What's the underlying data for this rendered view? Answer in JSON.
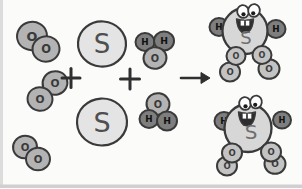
{
  "diagram": {
    "canvas": {
      "width": 302,
      "height": 188,
      "background": "#fbfbfa"
    },
    "ink": "#3a3a3a",
    "styles": {
      "O": {
        "fill": "#b3b3b3",
        "text": "#3a3a3a"
      },
      "H": {
        "fill": "#7e7e7e",
        "text": "#111111"
      },
      "S": {
        "fill": "#e4e4e4",
        "text": "#4f4f4f"
      },
      "body": {
        "fill": "#d7d7d7"
      },
      "legO": {
        "fill": "#c3c3c3"
      },
      "eye": {
        "white": "#ffffff",
        "pupil": "#1c1c1c"
      },
      "mouth": {
        "dark": "#2d2d2d",
        "teeth": "#ffffff"
      },
      "product_label_text": "#6e6e6e",
      "operator": "#2f2f2f",
      "edge_left_band": "#dcdcdc",
      "edge_bottom_band": "#d0d0d0"
    },
    "reactants": [
      {
        "name": "oxygen-molecule-1",
        "formula": "O2",
        "atoms": [
          {
            "el": "O",
            "x": 32,
            "y": 36,
            "r": 15,
            "tilt": -14
          },
          {
            "el": "O",
            "x": 46,
            "y": 49,
            "r": 13.5,
            "tilt": -8
          }
        ]
      },
      {
        "name": "oxygen-molecule-2",
        "formula": "O2",
        "atoms": [
          {
            "el": "O",
            "x": 55,
            "y": 83,
            "r": 12.5,
            "tilt": -18
          },
          {
            "el": "O",
            "x": 40,
            "y": 99,
            "r": 12.5,
            "tilt": 10
          }
        ]
      },
      {
        "name": "oxygen-molecule-3",
        "formula": "O2",
        "atoms": [
          {
            "el": "O",
            "x": 25,
            "y": 147,
            "r": 12,
            "tilt": -12
          },
          {
            "el": "O",
            "x": 38,
            "y": 159,
            "r": 12,
            "tilt": 0
          }
        ]
      },
      {
        "name": "sulfur-atom-1",
        "formula": "S",
        "atoms": [
          {
            "el": "S",
            "x": 102,
            "y": 44,
            "r": 24,
            "fs": 26,
            "tilt": 4
          }
        ]
      },
      {
        "name": "sulfur-atom-2",
        "formula": "S",
        "atoms": [
          {
            "el": "S",
            "x": 102,
            "y": 122,
            "r": 25,
            "fs": 27,
            "tilt": -3
          }
        ]
      },
      {
        "name": "water-molecule-1",
        "formula": "H2O",
        "atoms": [
          {
            "el": "H",
            "x": 145,
            "y": 42,
            "r": 9.5
          },
          {
            "el": "H",
            "x": 164,
            "y": 41,
            "r": 10
          },
          {
            "el": "O",
            "x": 155,
            "y": 58,
            "r": 11.5,
            "tilt": -10
          }
        ]
      },
      {
        "name": "water-molecule-2",
        "formula": "H2O",
        "atoms": [
          {
            "el": "O",
            "x": 158,
            "y": 104,
            "r": 11.5,
            "tilt": 8
          },
          {
            "el": "H",
            "x": 149,
            "y": 119,
            "r": 9.5
          },
          {
            "el": "H",
            "x": 167,
            "y": 121,
            "r": 10
          }
        ]
      }
    ],
    "operators": [
      {
        "type": "plus",
        "label": "+",
        "x": 71,
        "y": 78,
        "arm": 9
      },
      {
        "type": "plus",
        "label": "+",
        "x": 130,
        "y": 79,
        "arm": 9.5
      },
      {
        "type": "arrow",
        "label": "→",
        "x1": 181,
        "y1": 78,
        "x2": 210,
        "y2": 78
      }
    ],
    "products": [
      {
        "name": "sulfuric-acid-molecule-1",
        "formula": "H2SO4",
        "body": {
          "x": 245,
          "y": 31,
          "rx": 22.5,
          "ry": 23
        },
        "label": {
          "el": "S",
          "x": 246,
          "y": 38,
          "fs": 18
        },
        "hydrogens": [
          {
            "el": "H",
            "x": 219,
            "y": 27,
            "r": 9.5
          },
          {
            "el": "H",
            "x": 276,
            "y": 29,
            "r": 9.5
          }
        ],
        "oxygens": [
          {
            "el": "O",
            "x": 230,
            "y": 72,
            "r": 10
          },
          {
            "el": "O",
            "x": 236,
            "y": 56,
            "r": 9.5
          },
          {
            "el": "O",
            "x": 269,
            "y": 69,
            "r": 10.5
          },
          {
            "el": "O",
            "x": 262,
            "y": 55,
            "r": 9.5
          }
        ],
        "eyes": [
          {
            "x": 243,
            "y": 11.5
          },
          {
            "x": 254,
            "y": 10.5
          }
        ],
        "mouth": {
          "x": 245,
          "y": 25
        }
      },
      {
        "name": "sulfuric-acid-molecule-2",
        "formula": "H2SO4",
        "body": {
          "x": 248,
          "y": 128,
          "rx": 23.5,
          "ry": 24
        },
        "label": {
          "el": "S",
          "x": 251,
          "y": 132,
          "fs": 20
        },
        "hydrogens": [
          {
            "el": "H",
            "x": 224,
            "y": 121,
            "r": 9.5
          },
          {
            "el": "H",
            "x": 282,
            "y": 120,
            "r": 9
          }
        ],
        "oxygens": [
          {
            "el": "O",
            "x": 227,
            "y": 166,
            "r": 10
          },
          {
            "el": "O",
            "x": 232,
            "y": 153,
            "r": 10
          },
          {
            "el": "O",
            "x": 275,
            "y": 164,
            "r": 10.5
          },
          {
            "el": "O",
            "x": 271,
            "y": 152,
            "r": 10
          }
        ],
        "eyes": [
          {
            "x": 245,
            "y": 103.5
          },
          {
            "x": 256,
            "y": 102
          }
        ],
        "mouth": {
          "x": 247,
          "y": 118
        }
      }
    ]
  }
}
